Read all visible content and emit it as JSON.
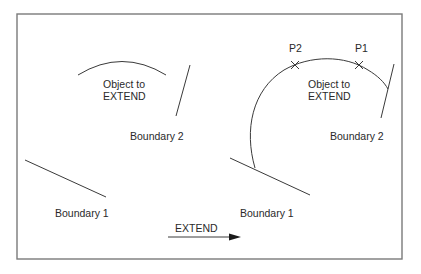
{
  "diagram": {
    "type": "cad-extend-illustration",
    "before": {
      "object_label_line1": "Object to",
      "object_label_line2": "EXTEND",
      "boundary1_label": "Boundary 1",
      "boundary2_label": "Boundary 2"
    },
    "after": {
      "object_label_line1": "Object to",
      "object_label_line2": "EXTEND",
      "boundary1_label": "Boundary 1",
      "boundary2_label": "Boundary 2",
      "point1_label": "P1",
      "point2_label": "P2"
    },
    "transition": {
      "label": "EXTEND"
    },
    "colors": {
      "line": "#3a3a3a",
      "frame": "#7a7a7a",
      "text": "#2a2a2a",
      "background": "#ffffff"
    }
  }
}
